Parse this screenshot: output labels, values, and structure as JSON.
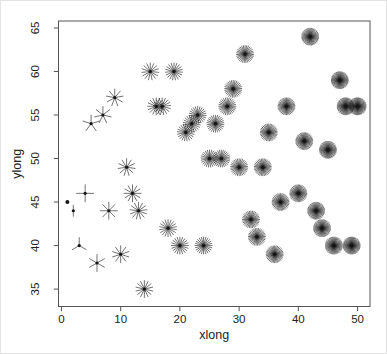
{
  "figure": {
    "background": "#ffffff",
    "border_color": "#e3e3e3"
  },
  "chart_data": {
    "type": "scatter",
    "title": "",
    "xlabel": "xlong",
    "ylabel": "ylong",
    "xticks": [
      0,
      10,
      20,
      30,
      40,
      50
    ],
    "yticks": [
      35,
      40,
      45,
      50,
      55,
      60,
      65
    ],
    "xlim": [
      -0.5,
      52.1
    ],
    "ylim": [
      33.0,
      65.8
    ],
    "grid": false,
    "legend": "none",
    "marker": "star-glyph: each point drawn as a star whose number of rays equals its x value",
    "marker_color": "#151515",
    "axis_color": "#555555",
    "points": [
      {
        "x": 1,
        "y": 45,
        "rays": 1
      },
      {
        "x": 2,
        "y": 44,
        "rays": 2
      },
      {
        "x": 3,
        "y": 40,
        "rays": 3
      },
      {
        "x": 4,
        "y": 46,
        "rays": 4
      },
      {
        "x": 5,
        "y": 54,
        "rays": 5
      },
      {
        "x": 6,
        "y": 38,
        "rays": 6
      },
      {
        "x": 7,
        "y": 55,
        "rays": 7
      },
      {
        "x": 8,
        "y": 44,
        "rays": 8
      },
      {
        "x": 9,
        "y": 57,
        "rays": 9
      },
      {
        "x": 10,
        "y": 39,
        "rays": 10
      },
      {
        "x": 11,
        "y": 49,
        "rays": 11
      },
      {
        "x": 12,
        "y": 46,
        "rays": 12
      },
      {
        "x": 13,
        "y": 44,
        "rays": 13
      },
      {
        "x": 14,
        "y": 35,
        "rays": 14
      },
      {
        "x": 15,
        "y": 60,
        "rays": 15
      },
      {
        "x": 16,
        "y": 56,
        "rays": 16
      },
      {
        "x": 17,
        "y": 56,
        "rays": 17
      },
      {
        "x": 18,
        "y": 42,
        "rays": 18
      },
      {
        "x": 19,
        "y": 60,
        "rays": 19
      },
      {
        "x": 20,
        "y": 40,
        "rays": 20
      },
      {
        "x": 21,
        "y": 53,
        "rays": 21
      },
      {
        "x": 22,
        "y": 54,
        "rays": 22
      },
      {
        "x": 23,
        "y": 55,
        "rays": 23
      },
      {
        "x": 24,
        "y": 40,
        "rays": 24
      },
      {
        "x": 25,
        "y": 50,
        "rays": 25
      },
      {
        "x": 26,
        "y": 54,
        "rays": 26
      },
      {
        "x": 27,
        "y": 50,
        "rays": 27
      },
      {
        "x": 28,
        "y": 56,
        "rays": 28
      },
      {
        "x": 29,
        "y": 58,
        "rays": 29
      },
      {
        "x": 30,
        "y": 49,
        "rays": 30
      },
      {
        "x": 31,
        "y": 62,
        "rays": 31
      },
      {
        "x": 32,
        "y": 43,
        "rays": 32
      },
      {
        "x": 33,
        "y": 41,
        "rays": 33
      },
      {
        "x": 34,
        "y": 49,
        "rays": 34
      },
      {
        "x": 35,
        "y": 53,
        "rays": 35
      },
      {
        "x": 36,
        "y": 39,
        "rays": 36
      },
      {
        "x": 37,
        "y": 45,
        "rays": 37
      },
      {
        "x": 38,
        "y": 56,
        "rays": 38
      },
      {
        "x": 40,
        "y": 46,
        "rays": 40
      },
      {
        "x": 41,
        "y": 52,
        "rays": 41
      },
      {
        "x": 42,
        "y": 64,
        "rays": 42
      },
      {
        "x": 43,
        "y": 44,
        "rays": 43
      },
      {
        "x": 44,
        "y": 42,
        "rays": 44
      },
      {
        "x": 45,
        "y": 51,
        "rays": 45
      },
      {
        "x": 46,
        "y": 40,
        "rays": 46
      },
      {
        "x": 47,
        "y": 59,
        "rays": 47
      },
      {
        "x": 48,
        "y": 56,
        "rays": 48
      },
      {
        "x": 49,
        "y": 40,
        "rays": 49
      },
      {
        "x": 50,
        "y": 56,
        "rays": 50
      }
    ]
  }
}
